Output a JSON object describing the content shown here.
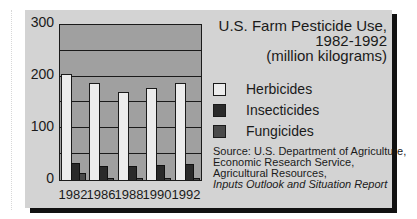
{
  "chart_data": {
    "type": "bar",
    "title": "U.S. Farm Pesticide Use, 1982-1992 (million kilograms)",
    "title_lines": [
      "U.S. Farm Pesticide Use,",
      "1982-1992",
      "(million kilograms)"
    ],
    "xlabel": "",
    "ylabel": "",
    "categories": [
      "1982",
      "1986",
      "1988",
      "1990",
      "1992"
    ],
    "series": [
      {
        "name": "Herbicides",
        "values": [
          205,
          187,
          170,
          179,
          188
        ],
        "color": "#ececec"
      },
      {
        "name": "Insecticides",
        "values": [
          33,
          27,
          28,
          29,
          31
        ],
        "color": "#2a2a2a"
      },
      {
        "name": "Fungicides",
        "values": [
          14,
          4,
          4,
          4,
          4
        ],
        "color": "#4a4a4a"
      }
    ],
    "ylim": [
      0,
      300
    ],
    "yticks": [
      "300",
      "200",
      "100",
      "0"
    ],
    "gridlines": [
      50,
      100,
      150,
      200,
      250
    ],
    "grid": true,
    "legend_position": "right",
    "source_lines": [
      "Source: U.S. Department of Agriculture,",
      "Economic Research Service,",
      "Agricultural Resources,"
    ],
    "source_italic": "Inputs Outlook and Situation Report"
  },
  "colors": {
    "panel_bg": "#d3d3d3",
    "plot_bg": "#a0a0a0",
    "shadow": "#111111"
  }
}
